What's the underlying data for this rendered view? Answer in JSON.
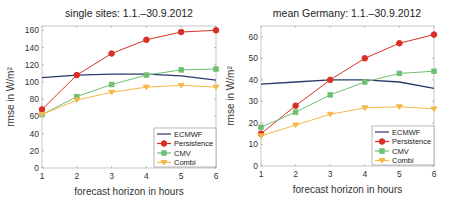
{
  "colors": {
    "ECMWF": "#2b3a6b",
    "Persistence": "#d93025",
    "CMV": "#6fbf73",
    "Combi": "#f5b84a"
  },
  "chart_data": [
    {
      "type": "line",
      "title": "single sites: 1.1.–30.9.2012",
      "xlabel": "forecast horizon in hours",
      "ylabel": "rmse in W/m²",
      "x": [
        1,
        2,
        3,
        4,
        5,
        6
      ],
      "xlim": [
        1,
        6
      ],
      "ylim": [
        0,
        165
      ],
      "yticks": [
        0,
        20,
        40,
        60,
        80,
        100,
        120,
        140,
        160
      ],
      "xticks": [
        1,
        2,
        3,
        4,
        5,
        6
      ],
      "legend_position": "lower right",
      "series": [
        {
          "name": "ECMWF",
          "marker": "none",
          "values": [
            105,
            108,
            109,
            109,
            107,
            102
          ]
        },
        {
          "name": "Persistence",
          "marker": "circle",
          "values": [
            68,
            108,
            133,
            149,
            158,
            160
          ]
        },
        {
          "name": "CMV",
          "marker": "square",
          "values": [
            62,
            83,
            97,
            108,
            114,
            115
          ]
        },
        {
          "name": "Combi",
          "marker": "triangle-down",
          "values": [
            62,
            79,
            88,
            94,
            96,
            94
          ]
        }
      ]
    },
    {
      "type": "line",
      "title": "mean Germany: 1.1.–30.9.2012",
      "xlabel": "forecast horizon in hours",
      "ylabel": "rmse in W/m²",
      "x": [
        1,
        2,
        3,
        4,
        5,
        6
      ],
      "xlim": [
        1,
        6
      ],
      "ylim": [
        0,
        65
      ],
      "yticks": [
        0,
        10,
        20,
        30,
        40,
        50,
        60
      ],
      "xticks": [
        1,
        2,
        3,
        4,
        5,
        6
      ],
      "legend_position": "lower right",
      "series": [
        {
          "name": "ECMWF",
          "marker": "none",
          "values": [
            38,
            39,
            40,
            40,
            39,
            36
          ]
        },
        {
          "name": "Persistence",
          "marker": "circle",
          "values": [
            15,
            28,
            40,
            50,
            57,
            61
          ]
        },
        {
          "name": "CMV",
          "marker": "square",
          "values": [
            18,
            25,
            33,
            39,
            43,
            44
          ]
        },
        {
          "name": "Combi",
          "marker": "triangle-down",
          "values": [
            14,
            19,
            24,
            27,
            27.5,
            26.5
          ]
        }
      ]
    }
  ]
}
